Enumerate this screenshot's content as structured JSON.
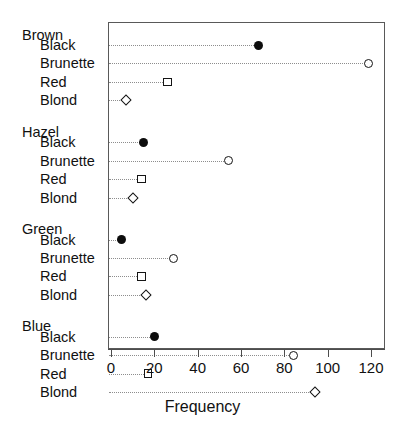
{
  "chart_data": {
    "type": "scatter",
    "subtype": "cleveland-dot-plot",
    "title": "",
    "xlabel": "Frequency",
    "ylabel": "",
    "xlim": [
      0,
      120
    ],
    "xticks": [
      0,
      20,
      40,
      60,
      80,
      100,
      120
    ],
    "xtick_labels": [
      "0",
      "20",
      "40",
      "60",
      "80",
      "100",
      "120"
    ],
    "grid": false,
    "legend": false,
    "dotted_leader_lines": true,
    "group_variable": "Eye",
    "item_variable": "Hair",
    "value_variable": "Frequency",
    "groups": [
      {
        "name": "Brown",
        "items": [
          {
            "label": "Black",
            "value": 68,
            "marker": "filled-circle"
          },
          {
            "label": "Brunette",
            "value": 119,
            "marker": "open-circle"
          },
          {
            "label": "Red",
            "value": 26,
            "marker": "square"
          },
          {
            "label": "Blond",
            "value": 7,
            "marker": "diamond"
          }
        ]
      },
      {
        "name": "Hazel",
        "items": [
          {
            "label": "Black",
            "value": 15,
            "marker": "filled-circle"
          },
          {
            "label": "Brunette",
            "value": 54,
            "marker": "open-circle"
          },
          {
            "label": "Red",
            "value": 14,
            "marker": "square"
          },
          {
            "label": "Blond",
            "value": 10,
            "marker": "diamond"
          }
        ]
      },
      {
        "name": "Green",
        "items": [
          {
            "label": "Black",
            "value": 5,
            "marker": "filled-circle"
          },
          {
            "label": "Brunette",
            "value": 29,
            "marker": "open-circle"
          },
          {
            "label": "Red",
            "value": 14,
            "marker": "square"
          },
          {
            "label": "Blond",
            "value": 16,
            "marker": "diamond"
          }
        ]
      },
      {
        "name": "Blue",
        "items": [
          {
            "label": "Black",
            "value": 20,
            "marker": "filled-circle"
          },
          {
            "label": "Brunette",
            "value": 84,
            "marker": "open-circle"
          },
          {
            "label": "Red",
            "value": 17,
            "marker": "square"
          },
          {
            "label": "Blond",
            "value": 94,
            "marker": "diamond"
          }
        ]
      }
    ],
    "colors": {
      "marker_stroke": "#141414",
      "marker_fill_solid": "#0d0d0d",
      "marker_fill_open": "#ffffff",
      "leader_line": "#8d8d8d",
      "axis": "#4d4d4d",
      "frame": "#595959",
      "text": "#111111",
      "background": "#ffffff"
    }
  },
  "layout": {
    "plot_left_px": 108,
    "plot_top_px": 22,
    "plot_width_px": 277,
    "plot_height_px": 327,
    "x_zero_px": 111,
    "x_max_px": 371,
    "first_row_y_px": 45,
    "row_step_px": 18.4,
    "group_gap_px": 12.0,
    "group_header_offset_px": 17.5
  }
}
